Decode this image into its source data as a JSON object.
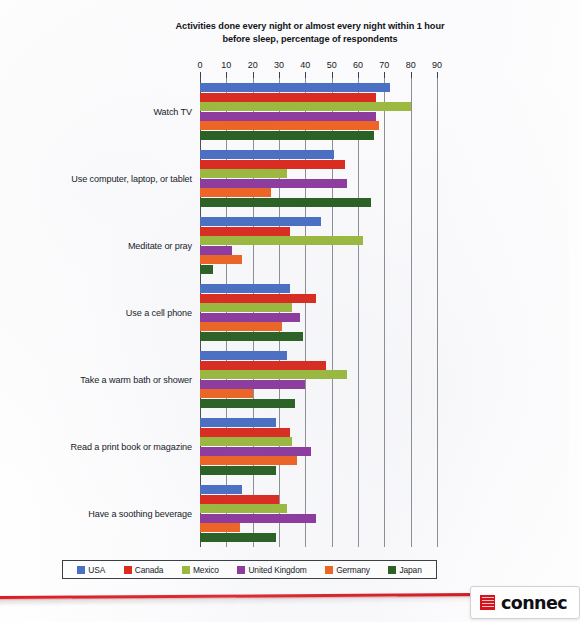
{
  "chart_data": {
    "type": "bar",
    "orientation": "horizontal",
    "title": "Activities done every night or almost every night within 1 hour before sleep, percentage of respondents",
    "title_line1": "Activities done every night or almost every night within 1 hour",
    "title_line2": "before sleep, percentage of respondents",
    "xlabel": "",
    "ylabel": "",
    "xlim": [
      0,
      90
    ],
    "xticks": [
      0,
      10,
      20,
      30,
      40,
      50,
      60,
      70,
      80,
      90
    ],
    "xtick_labels": [
      "0",
      "10",
      "20",
      "30",
      "40",
      "50",
      "60",
      "70",
      "80",
      "90"
    ],
    "grid": true,
    "grid_axis": "x",
    "legend_position": "bottom",
    "categories": [
      "Watch TV",
      "Use computer, laptop, or tablet",
      "Meditate or pray",
      "Use a cell phone",
      "Take a warm bath or shower",
      "Read a print book or magazine",
      "Have a soothing beverage"
    ],
    "series": [
      {
        "name": "USA",
        "color": "#4a6fc4",
        "values": [
          72,
          51,
          46,
          34,
          33,
          29,
          16
        ]
      },
      {
        "name": "Canada",
        "color": "#dc2a1e",
        "values": [
          67,
          55,
          34,
          44,
          48,
          34,
          30
        ]
      },
      {
        "name": "Mexico",
        "color": "#9cba3e",
        "values": [
          80,
          33,
          62,
          35,
          56,
          35,
          33
        ]
      },
      {
        "name": "United Kingdom",
        "color": "#8e3a9e",
        "values": [
          67,
          56,
          12,
          38,
          40,
          42,
          44
        ]
      },
      {
        "name": "Germany",
        "color": "#f06423",
        "values": [
          68,
          27,
          16,
          31,
          20,
          37,
          15
        ]
      },
      {
        "name": "Japan",
        "color": "#2a6123",
        "values": [
          66,
          65,
          5,
          39,
          36,
          29,
          29
        ]
      }
    ]
  },
  "footer": {
    "logo_word": "connec",
    "logo_mark_name": "red-square-mark"
  }
}
